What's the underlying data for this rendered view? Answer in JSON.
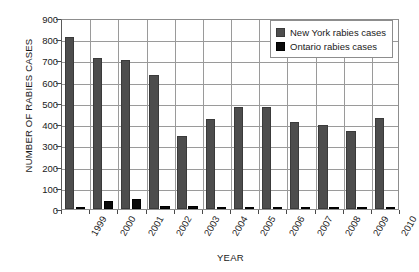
{
  "chart_data": {
    "type": "bar",
    "title": "",
    "xlabel": "YEAR",
    "ylabel": "NUMBER OF RABIES CASES",
    "ylim": [
      0,
      900
    ],
    "yticks": [
      0,
      100,
      200,
      300,
      400,
      500,
      600,
      700,
      800,
      900
    ],
    "grid": true,
    "legend_position": "top-right",
    "categories": [
      "1999",
      "2000",
      "2001",
      "2002",
      "2003",
      "2004",
      "2005",
      "2006",
      "2007",
      "2008",
      "2009",
      "2010"
    ],
    "series": [
      {
        "name": "New York rabies cases",
        "color": "#4d4d4d",
        "values": [
          810,
          712,
          704,
          632,
          343,
          425,
          483,
          483,
          412,
          396,
          366,
          428
        ]
      },
      {
        "name": "Ontario rabies cases",
        "color": "#0a0a0a",
        "values": [
          8,
          37,
          48,
          15,
          16,
          5,
          2,
          1,
          1,
          1,
          1,
          1
        ]
      }
    ]
  },
  "legend": {
    "entries": [
      {
        "label": "New York rabies cases",
        "swatch": "dark-gray-square"
      },
      {
        "label": "Ontario rabies cases",
        "swatch": "black-square"
      }
    ]
  }
}
